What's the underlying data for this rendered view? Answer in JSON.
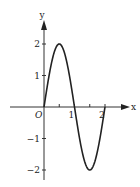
{
  "chart_data": {
    "type": "line",
    "title": "",
    "function": "y = 2 sin(πx)",
    "xlabel": "x",
    "ylabel": "y",
    "origin_label": "O",
    "xlim": [
      0,
      2
    ],
    "ylim": [
      -2,
      2
    ],
    "x_ticks": [
      0.5,
      1,
      1.5,
      2
    ],
    "x_tick_labels": [
      {
        "value": 1,
        "label": "1"
      },
      {
        "value": 2,
        "label": "2"
      }
    ],
    "y_ticks": [
      {
        "value": 2,
        "label": "2"
      },
      {
        "value": 1,
        "label": "1"
      },
      {
        "value": -1,
        "label": "−1"
      },
      {
        "value": -2,
        "label": "−2"
      }
    ],
    "series": [
      {
        "name": "curve",
        "x": [
          0,
          0.25,
          0.5,
          0.75,
          1,
          1.25,
          1.5,
          1.75,
          2
        ],
        "y": [
          0,
          1.414,
          2,
          1.414,
          0,
          -1.414,
          -2,
          -1.414,
          0
        ]
      }
    ],
    "grid": false,
    "colors": {
      "curve": "#222222",
      "axis": "#333333"
    }
  }
}
